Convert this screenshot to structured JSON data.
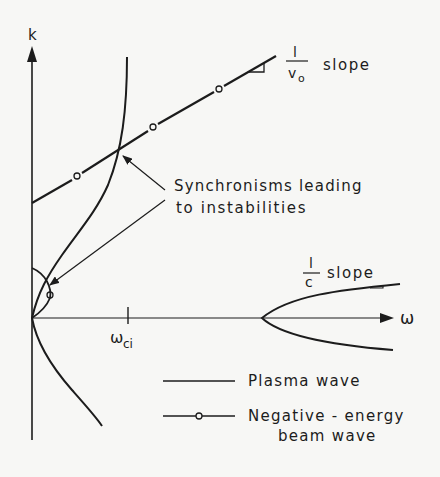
{
  "figure": {
    "axes": {
      "y_label": "k",
      "x_label": "ω",
      "x_tick_label_main": "ω",
      "x_tick_label_sub": "ci"
    },
    "annotations": {
      "beam_slope_num": "l",
      "beam_slope_den": "v",
      "beam_slope_den_sub": "o",
      "beam_slope_word": "slope",
      "light_slope_num": "l",
      "light_slope_den": "c",
      "light_slope_word": "slope",
      "synchronism_line1": "Synchronisms leading",
      "synchronism_line2": "to instabilities"
    },
    "legend": {
      "plasma_label": "Plasma wave",
      "beam_label_line1": "Negative - energy",
      "beam_label_line2": "beam wave"
    },
    "colors": {
      "ink": "#1c1c1c",
      "background": "#f7f7f5"
    }
  }
}
